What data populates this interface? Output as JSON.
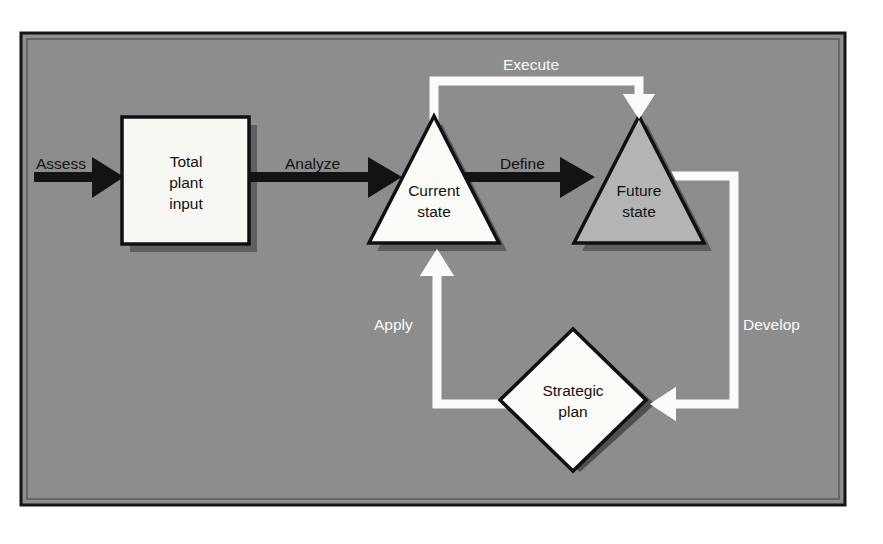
{
  "page": {
    "background_color": "#ffffff",
    "canvas_color": "#8d8d8d",
    "frame_border_color": "#141414"
  },
  "diagram": {
    "type": "process-flow-diagram",
    "nodes": [
      {
        "id": "total-plant-input",
        "label_lines": [
          "Total",
          "plant",
          "input"
        ],
        "shape": "rectangle",
        "fill": "#f7f7f4",
        "border": "#101010",
        "shadow": "#5c5c5c"
      },
      {
        "id": "current-state",
        "label_lines": [
          "Current",
          "state"
        ],
        "shape": "triangle",
        "fill": "#fbfbf8",
        "border": "#101010",
        "shadow": "#5c5c5c"
      },
      {
        "id": "future-state",
        "label_lines": [
          "Future",
          "state"
        ],
        "shape": "triangle",
        "fill": "#b4b4b4",
        "border": "#101010",
        "shadow": "#5c5c5c"
      },
      {
        "id": "strategic-plan",
        "label_lines": [
          "Strategic",
          "plan"
        ],
        "shape": "diamond",
        "fill": "#fbfbf8",
        "border": "#101010",
        "shadow": "#4f4f4f"
      }
    ],
    "connectors": [
      {
        "id": "assess",
        "label": "Assess",
        "style": "dark",
        "color": "#131313",
        "from": "external-input",
        "to": "total-plant-input"
      },
      {
        "id": "analyze",
        "label": "Analyze",
        "style": "dark",
        "color": "#131313",
        "from": "total-plant-input",
        "to": "current-state"
      },
      {
        "id": "define",
        "label": "Define",
        "style": "dark",
        "color": "#131313",
        "from": "current-state",
        "to": "future-state"
      },
      {
        "id": "execute",
        "label": "Execute",
        "style": "light",
        "color": "#fbfbfb",
        "from": "current-state",
        "to": "future-state"
      },
      {
        "id": "develop",
        "label": "Develop",
        "style": "light",
        "color": "#fbfbfb",
        "from": "future-state",
        "to": "strategic-plan"
      },
      {
        "id": "apply",
        "label": "Apply",
        "style": "light",
        "color": "#fbfbfb",
        "from": "strategic-plan",
        "to": "current-state"
      }
    ]
  }
}
